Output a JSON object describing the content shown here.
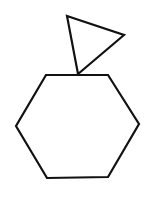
{
  "figure": {
    "width": 145,
    "height": 198,
    "background": "#ffffff",
    "stroke_color": "#111111",
    "stroke_width": 2.2,
    "shapes": [
      {
        "name": "triangle",
        "points": "67,16 124,35 78,74"
      },
      {
        "name": "hexagon",
        "points": "46,75 108,75 139,124 108,177 47,178 16,126"
      }
    ]
  }
}
